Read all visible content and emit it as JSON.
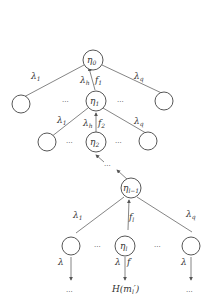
{
  "diagram": {
    "type": "tree-chain",
    "nodes": {
      "root": {
        "label": "η",
        "sub": "0"
      },
      "level1": {
        "label": "η",
        "sub": "1"
      },
      "level2": {
        "label": "η",
        "sub": "2"
      },
      "levelL1": {
        "label": "η",
        "sub": "l−1"
      },
      "levelL": {
        "label": "η",
        "sub": "l"
      }
    },
    "edges": {
      "root_left": {
        "label": "λ",
        "sub": "1"
      },
      "root_mid_lambda": {
        "label": "λ",
        "sub": "h"
      },
      "root_mid_f": {
        "label": "f",
        "sub": "1"
      },
      "root_right": {
        "label": "λ",
        "sub": "q"
      },
      "l1_left": {
        "label": "λ",
        "sub": "1"
      },
      "l1_mid_lambda": {
        "label": "λ",
        "sub": "h"
      },
      "l1_mid_f": {
        "label": "f",
        "sub": "2"
      },
      "l1_right": {
        "label": "λ",
        "sub": "q"
      },
      "ll_left": {
        "label": "λ",
        "sub": "1"
      },
      "ll_mid_f": {
        "label": "f",
        "sub": "l"
      },
      "ll_right": {
        "label": "λ",
        "sub": "q"
      },
      "leaf_left": {
        "label": "λ"
      },
      "leaf_mid_lambda": {
        "label": "λ"
      },
      "leaf_mid_f": {
        "label": "f",
        "sup": "′"
      },
      "leaf_right": {
        "label": "λ"
      }
    },
    "ellipsis": "...",
    "terminal_label": "H(m",
    "terminal_sub": "l",
    "terminal_suffix": "′)"
  }
}
